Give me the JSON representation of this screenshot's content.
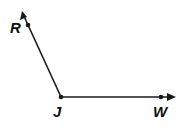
{
  "diagram": {
    "type": "angle",
    "vertex": {
      "label": "J",
      "x": 61,
      "y": 97
    },
    "rays": [
      {
        "name": "ray-JR",
        "through": {
          "label": "R",
          "x": 28,
          "y": 25
        },
        "arrow_tip": {
          "x": 22,
          "y": 11
        }
      },
      {
        "name": "ray-JW",
        "through": {
          "label": "W",
          "x": 161,
          "y": 97
        },
        "arrow_tip": {
          "x": 176,
          "y": 97
        }
      }
    ],
    "labels": {
      "R": "R",
      "J": "J",
      "W": "W"
    },
    "colors": {
      "stroke": "#1a1a1a",
      "background": "#ffffff"
    }
  }
}
